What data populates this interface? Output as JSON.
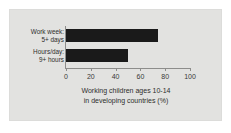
{
  "chart_data": {
    "type": "bar",
    "orientation": "horizontal",
    "title": "",
    "categories": [
      "Work week: 5+ days",
      "Hours/day: 9+ hours"
    ],
    "category_lines": [
      [
        "Work week:",
        "5+ days"
      ],
      [
        "Hours/day:",
        "9+ hours"
      ]
    ],
    "values": [
      74,
      50
    ],
    "xlabel_lines": [
      "Working children ages 10-14",
      "in developing countries (%)"
    ],
    "xlabel": "Working children ages 10-14 in developing countries (%)",
    "ylabel": "",
    "xlim": [
      0,
      100
    ],
    "xticks": [
      0,
      20,
      40,
      60,
      80,
      100
    ],
    "xtick_labels": [
      "0",
      "20",
      "40",
      "60",
      "80",
      "100"
    ],
    "grid": false,
    "legend": null,
    "colors": {
      "bar": "#1a1a1a",
      "panel_background": "#e2e2e0",
      "figure_background": "#ffffff",
      "axis": "#8d8d8b",
      "text": "#2e2e2c"
    }
  }
}
